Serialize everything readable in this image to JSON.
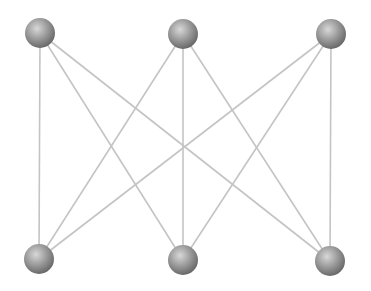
{
  "diagram": {
    "type": "bipartite-graph",
    "name": "K3,3",
    "edge_color": "#c4c4c4",
    "node_color": "#8a8a8a",
    "node_highlight": "#d8d8d8",
    "node_radius": 15,
    "nodes": [
      {
        "id": "t1",
        "x": 40,
        "y": 33
      },
      {
        "id": "t2",
        "x": 183,
        "y": 34
      },
      {
        "id": "t3",
        "x": 331,
        "y": 34
      },
      {
        "id": "b1",
        "x": 39,
        "y": 259
      },
      {
        "id": "b2",
        "x": 183,
        "y": 260
      },
      {
        "id": "b3",
        "x": 330,
        "y": 261
      }
    ],
    "edges": [
      [
        "t1",
        "b1"
      ],
      [
        "t1",
        "b2"
      ],
      [
        "t1",
        "b3"
      ],
      [
        "t2",
        "b1"
      ],
      [
        "t2",
        "b2"
      ],
      [
        "t2",
        "b3"
      ],
      [
        "t3",
        "b1"
      ],
      [
        "t3",
        "b2"
      ],
      [
        "t3",
        "b3"
      ]
    ]
  }
}
